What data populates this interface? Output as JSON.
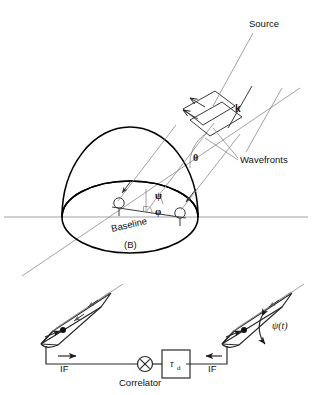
{
  "figure": {
    "background_color": "#ffffff",
    "line_color": "#000000",
    "thin_line_color": "#8a8a8a"
  },
  "upper_panel": {
    "name": "hemisphere-geometry-panel",
    "labels": {
      "source": "Source",
      "wave_vector": "k",
      "wavefronts": "Wavefronts",
      "theta": "θ",
      "psi": "ψ",
      "phi": "φ",
      "baseline": "Baseline",
      "baseline_symbol": "(B)"
    },
    "elements": {
      "dome": "hemisphere-dome",
      "horizon_ellipse": "horizon-ellipse",
      "horizontal_axis": "horizontal-reference-line",
      "antenna_left": "antenna-element-left",
      "antenna_right": "antenna-element-right",
      "wavefront_plane_1": "wavefront-plane-near",
      "wavefront_plane_2": "wavefront-plane-far",
      "right_angle_marker": "right-angle-marker"
    }
  },
  "lower_panel": {
    "name": "correlator-block-diagram",
    "labels": {
      "if_left": "IF",
      "if_right": "IF",
      "correlator": "Correlator",
      "delay_tau": "τ",
      "delay_subscript": "d",
      "psi_of_t": "ψ(t)"
    },
    "elements": {
      "antenna_left": "horn-antenna-left",
      "antenna_right": "horn-antenna-right",
      "correlator_symbol": "multiplier-circle-icon",
      "delay_box": "delay-line-box",
      "signal_path": "if-signal-path"
    }
  }
}
